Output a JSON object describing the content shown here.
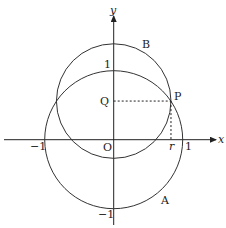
{
  "diagram": {
    "axes": {
      "x_label": "x",
      "y_label": "y"
    },
    "tick_labels": {
      "x_neg": "−1",
      "x_pos": "1",
      "y_pos": "1",
      "y_neg": "−1",
      "origin": "O",
      "r": "r"
    },
    "points": {
      "P": "P",
      "Q": "Q"
    },
    "circles": {
      "A": {
        "label": "A",
        "center": [
          0,
          0
        ],
        "radius": 1
      },
      "B": {
        "label": "B",
        "center": [
          0,
          0.56
        ],
        "radius": 0.83
      }
    },
    "point_P": [
      0.83,
      0.56
    ]
  }
}
